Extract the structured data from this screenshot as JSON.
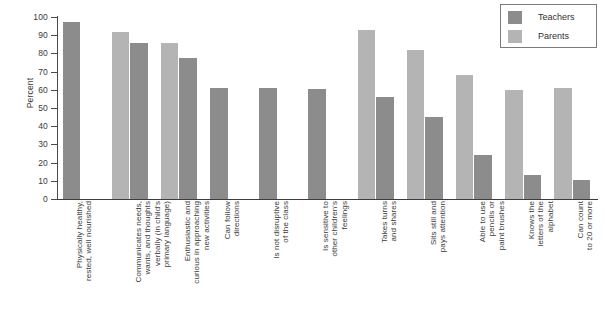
{
  "chart_data": {
    "type": "bar",
    "title": "",
    "subtitle": "",
    "xlabel": "",
    "ylabel": "Percent",
    "ylim": [
      0,
      100
    ],
    "ytick_step": 10,
    "yticks": [
      0,
      10,
      20,
      30,
      40,
      50,
      60,
      70,
      80,
      90,
      100
    ],
    "grid": false,
    "legend_position": "top-right",
    "categories": [
      "Physically healthy,\nrested, well nourished",
      "Communicates needs,\nwants, and thoughts\nverbally (in child's\nprimary language)",
      "Enthusiastic and\ncurious in approaching\nnew activities",
      "Can follow\ndirections",
      "Is not disruptive\nof the class",
      "Is sensitive to\nother children's\nfeelings",
      "Takes turns\nand shares",
      "Sits still and\npays attention",
      "Able to use\npencils or\npaint brushes",
      "Knows the\nletters of the\nalphabet",
      "Can count\nto 20 or more"
    ],
    "series": [
      {
        "name": "Teachers",
        "color": "#8c8c8c",
        "values": [
          97,
          85.5,
          77.5,
          61,
          61,
          60.5,
          56,
          45,
          24,
          13,
          10.5
        ]
      },
      {
        "name": "Parents",
        "color": "#b4b4b4",
        "values": [
          null,
          92,
          85.5,
          null,
          null,
          null,
          93,
          82,
          68,
          60,
          61
        ]
      }
    ],
    "series_draw_order": [
      "Parents",
      "Teachers"
    ],
    "legend": [
      {
        "label": "Teachers",
        "color": "#8c8c8c"
      },
      {
        "label": "Parents",
        "color": "#b4b4b4"
      }
    ]
  }
}
